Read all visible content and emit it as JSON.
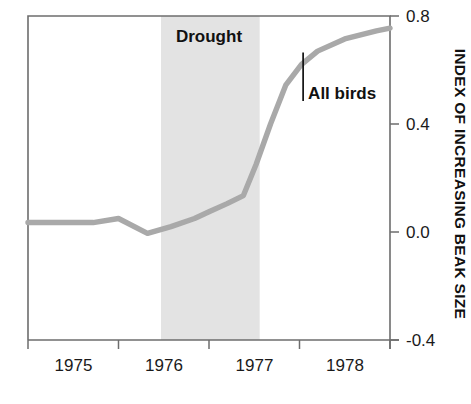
{
  "chart_data": {
    "type": "line",
    "title": "",
    "subtitle": "",
    "xlabel": "",
    "ylabel": "INDEX OF INCREASING BEAK SIZE",
    "xlim": [
      1974.0,
      1978.0
    ],
    "ylim": [
      -0.4,
      0.8
    ],
    "grid": false,
    "legend_position": "inline-annotation",
    "x_ticks": [
      {
        "value": 1975,
        "label": "1975"
      },
      {
        "value": 1976,
        "label": "1976"
      },
      {
        "value": 1977,
        "label": "1977"
      },
      {
        "value": 1978,
        "label": "1978"
      }
    ],
    "y_ticks": [
      {
        "value": 0.8,
        "label": "0.8"
      },
      {
        "value": 0.4,
        "label": "0.4"
      },
      {
        "value": 0.0,
        "label": "0.0"
      },
      {
        "value": -0.4,
        "label": "-0.4"
      }
    ],
    "series": [
      {
        "name": "All birds",
        "color": "#a9a9a9",
        "x": [
          1974.0,
          1974.35,
          1974.72,
          1975.0,
          1975.32,
          1975.58,
          1975.84,
          1976.0,
          1976.2,
          1976.38,
          1976.52,
          1976.68,
          1976.85,
          1977.02,
          1977.2,
          1977.5,
          1977.85,
          1978.0
        ],
        "values": [
          0.035,
          0.035,
          0.035,
          0.05,
          -0.005,
          0.02,
          0.05,
          0.075,
          0.105,
          0.135,
          0.25,
          0.4,
          0.545,
          0.62,
          0.67,
          0.715,
          0.745,
          0.755
        ]
      }
    ],
    "shaded_regions": [
      {
        "name": "drought-band",
        "label": "Drought",
        "x_start": 1975.47,
        "x_end": 1976.56,
        "color": "#e3e3e3"
      }
    ],
    "annotations": [
      {
        "name": "all-birds-callout",
        "text": "All birds",
        "leader_x": 1977.04,
        "leader_y_top": 0.665,
        "leader_y_bottom": 0.485
      },
      {
        "name": "drought-band-label",
        "text": "Drought",
        "x": 1976.0,
        "y": 0.705
      }
    ]
  },
  "axis": {
    "frame_color": "#6d6d6d",
    "tick_color": "#6d6d6d"
  }
}
